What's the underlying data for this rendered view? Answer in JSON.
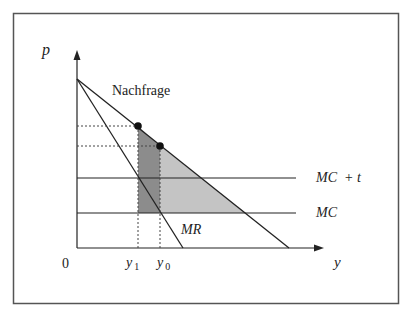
{
  "diagram": {
    "colors": {
      "frame": "#555555",
      "line": "#222222",
      "dark_region": "#8c8c8c",
      "light_region": "#c4c4c4"
    },
    "axes": {
      "y_label": "p",
      "x_label": "y",
      "origin_label": "0"
    },
    "curves": {
      "demand_label": "Nachfrage",
      "mr_label": "MR",
      "mc_label": "MC",
      "mc_tax_label": "MC  + t"
    },
    "quantities": {
      "y1_base": "y",
      "y1_sub": "1",
      "y0_base": "y",
      "y0_sub": "0"
    }
  }
}
